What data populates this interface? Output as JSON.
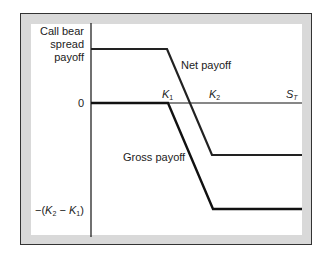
{
  "diagram": {
    "title": "Call bear spread payoff",
    "y_axis_label_lines": [
      "Call bear",
      "spread",
      "payoff"
    ],
    "y_zero_label": "0",
    "y_min_label": "−(K2 − K1)",
    "x_axis_label": "ST",
    "strike_labels": [
      "K1",
      "K2"
    ],
    "series": [
      {
        "name": "Net payoff",
        "label": "Net payoff",
        "color": "#111111"
      },
      {
        "name": "Gross payoff",
        "label": "Gross payoff",
        "color": "#111111"
      }
    ],
    "colors": {
      "frame": "#d9d9d9",
      "border": "#333333",
      "line": "#111111",
      "background": "#ffffff"
    }
  }
}
